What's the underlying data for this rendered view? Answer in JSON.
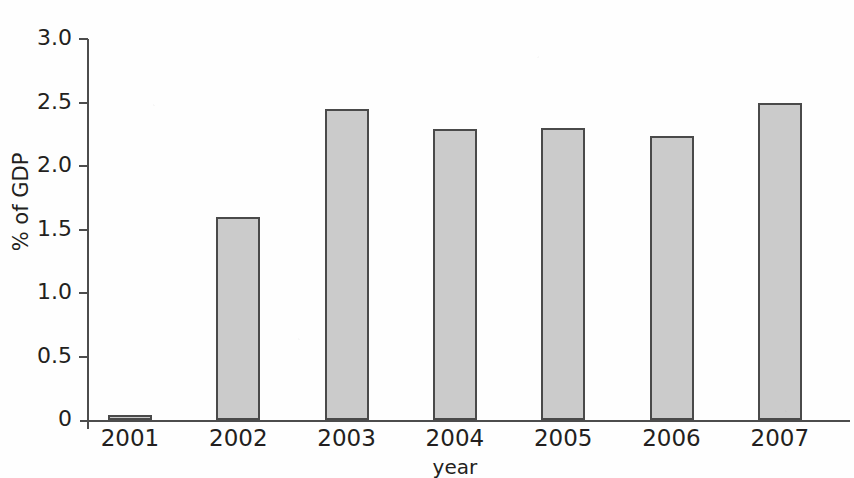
{
  "chart_data": {
    "type": "bar",
    "title": "",
    "title_note": "title row is cropped off at the top edge of the scan",
    "categories": [
      "2001",
      "2002",
      "2003",
      "2004",
      "2005",
      "2006",
      "2007"
    ],
    "values": [
      0.03,
      1.6,
      2.45,
      2.29,
      2.3,
      2.24,
      2.5
    ],
    "series": [
      {
        "name": "% of GDP",
        "values": [
          0.03,
          1.6,
          2.45,
          2.29,
          2.3,
          2.24,
          2.5
        ]
      }
    ],
    "xlabel": "year",
    "ylabel": "% of GDP",
    "ylim": [
      0,
      3.0
    ],
    "ytick_labels": [
      "3.0",
      "2.5",
      "2.0",
      "1.5",
      "1.0",
      "0.5",
      "0"
    ],
    "ytick_values": [
      3.0,
      2.5,
      2.0,
      1.5,
      1.0,
      0.5,
      0
    ],
    "grid": false,
    "legend": null,
    "legend_position": "none",
    "colors": {
      "bar_fill": "#cbcbcb",
      "bar_border": "#4a4a4a",
      "axis": "#4c4c4c",
      "text": "#231f20",
      "background": "#ffffff"
    }
  }
}
